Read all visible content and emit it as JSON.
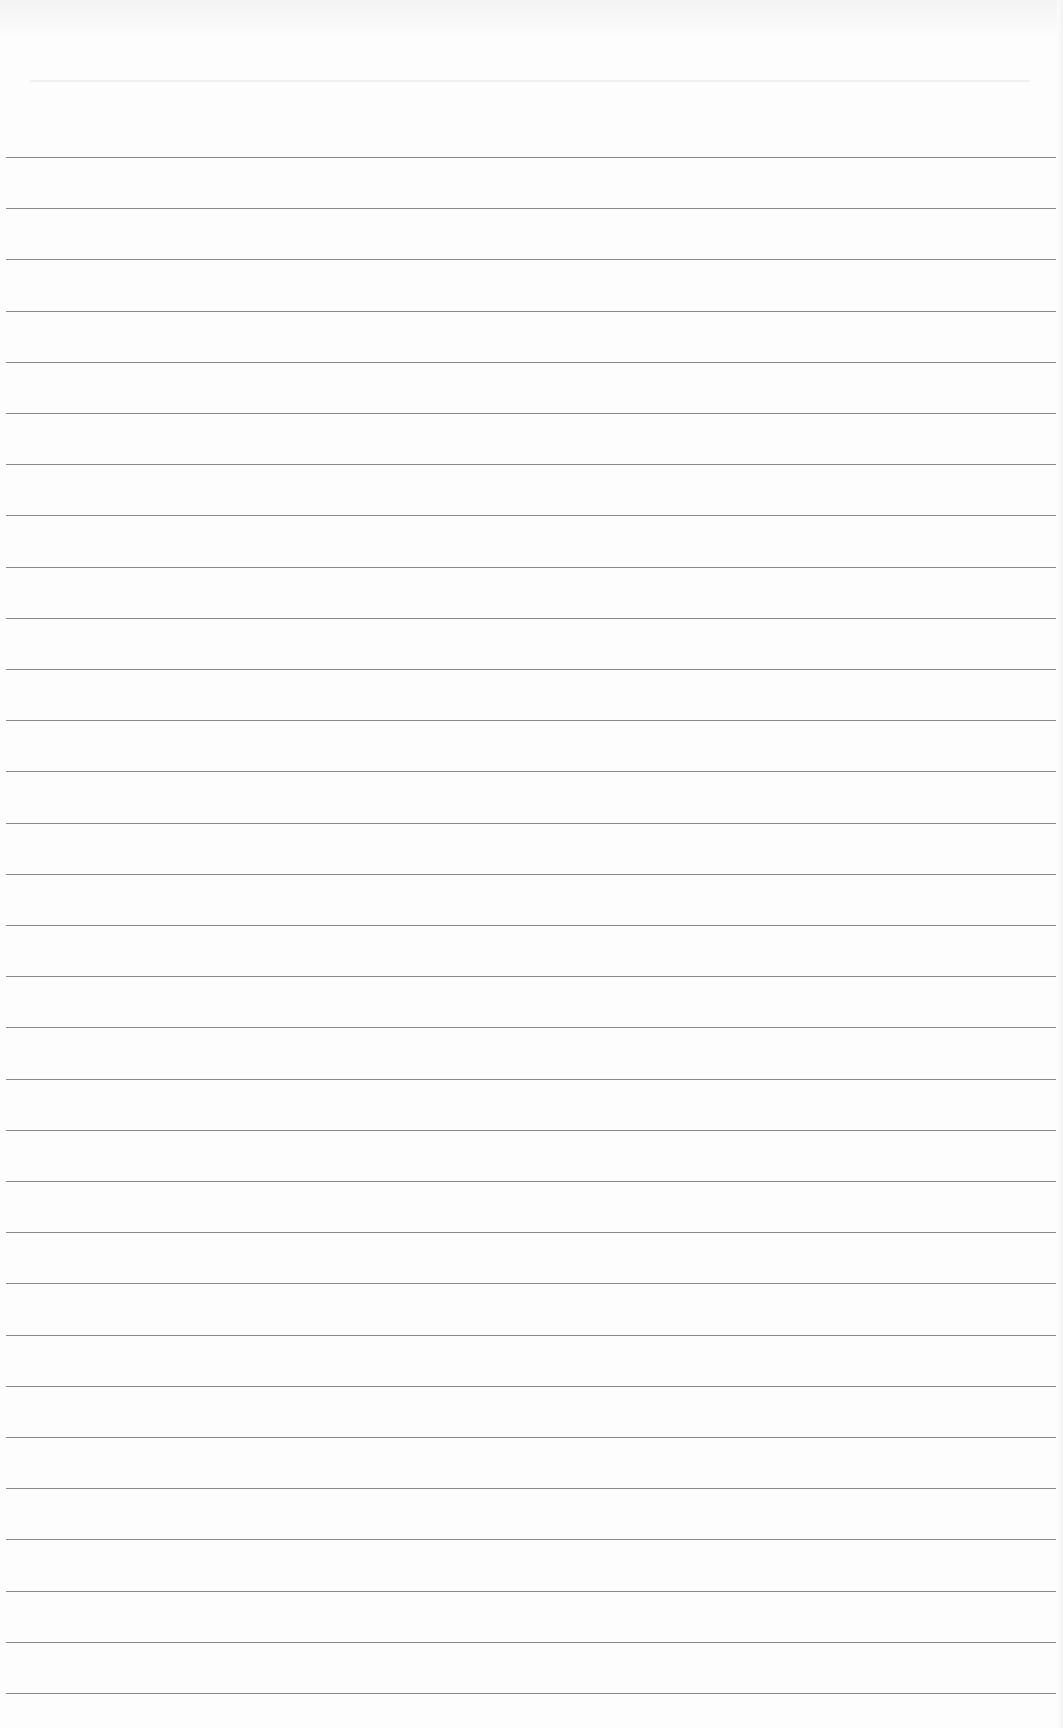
{
  "page": {
    "type": "ruled-paper",
    "background_color": "#fdfdfd",
    "line_color": "#8a8a8a",
    "line_count": 31,
    "first_line_y": 157,
    "line_spacing": 51.2,
    "text": ""
  }
}
